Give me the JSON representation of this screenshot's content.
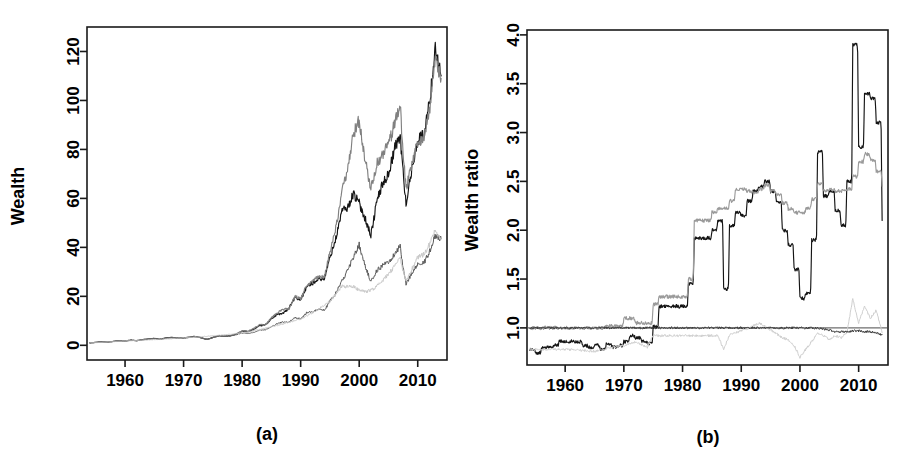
{
  "figure": {
    "background_color": "#ffffff",
    "panel_count": 2
  },
  "chart_data": [
    {
      "id": "panel-a",
      "type": "line",
      "title": "",
      "caption": "(a)",
      "xlabel": "",
      "ylabel": "Wealth",
      "xlim": [
        1953.5,
        2015.0
      ],
      "ylim": [
        -6,
        130
      ],
      "xticks": [
        1960,
        1970,
        1980,
        1990,
        2000,
        2010
      ],
      "xtick_labels": [
        "1960",
        "1970",
        "1980",
        "1990",
        "2000",
        "2010"
      ],
      "yticks": [
        0,
        20,
        40,
        60,
        80,
        100,
        120
      ],
      "ytick_labels": [
        "0",
        "20",
        "40",
        "60",
        "80",
        "100",
        "120"
      ],
      "grid": false,
      "legend": "none",
      "series": [
        {
          "name": "wealth-black",
          "color": "#141414",
          "x": [
            1954,
            1955,
            1956,
            1957,
            1958,
            1959,
            1960,
            1961,
            1962,
            1963,
            1964,
            1965,
            1966,
            1967,
            1968,
            1969,
            1970,
            1971,
            1972,
            1973,
            1974,
            1975,
            1976,
            1977,
            1978,
            1979,
            1980,
            1981,
            1982,
            1983,
            1984,
            1985,
            1986,
            1987,
            1988,
            1989,
            1990,
            1991,
            1992,
            1993,
            1994,
            1995,
            1996,
            1997,
            1998,
            1999,
            2000,
            2001,
            2002,
            2003,
            2004,
            2005,
            2006,
            2007,
            2008,
            2009,
            2010,
            2011,
            2012,
            2013,
            2014
          ],
          "values": [
            1.0,
            1.2,
            1.4,
            1.3,
            1.6,
            1.8,
            1.8,
            2.1,
            1.9,
            2.3,
            2.6,
            2.8,
            2.5,
            3.0,
            3.2,
            2.9,
            3.0,
            3.3,
            3.6,
            3.1,
            2.4,
            3.2,
            3.9,
            3.7,
            3.9,
            4.5,
            5.8,
            5.6,
            6.6,
            8.0,
            8.4,
            10.9,
            12.6,
            13.0,
            15.2,
            19.5,
            18.6,
            23.8,
            25.3,
            27.3,
            27.0,
            36.0,
            43.5,
            55.0,
            56.0,
            62.0,
            58.0,
            52.0,
            45.0,
            59.0,
            66.0,
            70.0,
            80.0,
            86.0,
            58.0,
            72.0,
            84.0,
            86.0,
            99.0,
            122.0,
            110.0
          ]
        },
        {
          "name": "wealth-gray-upper",
          "color": "#808080",
          "x": [
            1954,
            1955,
            1956,
            1957,
            1958,
            1959,
            1960,
            1961,
            1962,
            1963,
            1964,
            1965,
            1966,
            1967,
            1968,
            1969,
            1970,
            1971,
            1972,
            1973,
            1974,
            1975,
            1976,
            1977,
            1978,
            1979,
            1980,
            1981,
            1982,
            1983,
            1984,
            1985,
            1986,
            1987,
            1988,
            1989,
            1990,
            1991,
            1992,
            1993,
            1994,
            1995,
            1996,
            1997,
            1998,
            1999,
            2000,
            2001,
            2002,
            2003,
            2004,
            2005,
            2006,
            2007,
            2008,
            2009,
            2010,
            2011,
            2012,
            2013,
            2014
          ],
          "values": [
            1.0,
            1.2,
            1.4,
            1.3,
            1.6,
            1.8,
            1.8,
            2.1,
            1.9,
            2.3,
            2.6,
            2.8,
            2.5,
            3.0,
            3.2,
            2.9,
            3.0,
            3.3,
            3.6,
            3.1,
            2.4,
            3.2,
            3.9,
            3.7,
            3.9,
            4.6,
            6.0,
            5.8,
            6.9,
            8.4,
            8.6,
            11.2,
            13.4,
            14.6,
            15.0,
            20.0,
            19.0,
            24.5,
            26.0,
            28.0,
            28.0,
            38.0,
            48.0,
            62.0,
            72.0,
            86.0,
            92.0,
            76.0,
            64.0,
            74.0,
            78.0,
            82.0,
            90.0,
            99.0,
            64.0,
            74.0,
            83.0,
            84.0,
            96.0,
            117.0,
            109.0
          ]
        },
        {
          "name": "wealth-gray-lower",
          "color": "#5a5a5a",
          "x": [
            1954,
            1955,
            1956,
            1957,
            1958,
            1959,
            1960,
            1961,
            1962,
            1963,
            1964,
            1965,
            1966,
            1967,
            1968,
            1969,
            1970,
            1971,
            1972,
            1973,
            1974,
            1975,
            1976,
            1977,
            1978,
            1979,
            1980,
            1981,
            1982,
            1983,
            1984,
            1985,
            1986,
            1987,
            1988,
            1989,
            1990,
            1991,
            1992,
            1993,
            1994,
            1995,
            1996,
            1997,
            1998,
            1999,
            2000,
            2001,
            2002,
            2003,
            2004,
            2005,
            2006,
            2007,
            2008,
            2009,
            2010,
            2011,
            2012,
            2013,
            2014
          ],
          "values": [
            1.0,
            1.2,
            1.4,
            1.3,
            1.6,
            1.8,
            1.8,
            2.1,
            1.9,
            2.3,
            2.6,
            2.8,
            2.5,
            3.0,
            3.2,
            2.9,
            3.0,
            3.3,
            3.6,
            3.1,
            2.4,
            3.2,
            3.9,
            3.7,
            3.9,
            4.4,
            5.0,
            4.8,
            5.3,
            6.2,
            6.3,
            7.6,
            8.8,
            9.6,
            9.4,
            11.4,
            10.8,
            13.2,
            13.8,
            14.6,
            14.3,
            18.0,
            21.5,
            26.0,
            30.5,
            36.0,
            41.0,
            33.0,
            26.0,
            30.5,
            32.5,
            34.0,
            37.0,
            40.5,
            25.0,
            29.5,
            33.0,
            33.5,
            38.0,
            45.0,
            43.5
          ]
        },
        {
          "name": "wealth-lightgray",
          "color": "#c8c8c8",
          "x": [
            1954,
            1960,
            1970,
            1980,
            1985,
            1990,
            1995,
            1997,
            1999,
            2000,
            2001,
            2002,
            2003,
            2004,
            2005,
            2006,
            2007,
            2008,
            2009,
            2010,
            2011,
            2012,
            2013,
            2014
          ],
          "values": [
            1.0,
            1.8,
            3.0,
            5.0,
            7.6,
            10.8,
            18.0,
            24.0,
            24.0,
            22.5,
            22.0,
            22.5,
            24.0,
            26.5,
            29.0,
            32.0,
            36.0,
            26.0,
            31.0,
            36.0,
            37.0,
            41.0,
            47.0,
            43.5
          ]
        }
      ]
    },
    {
      "id": "panel-b",
      "type": "line",
      "title": "",
      "caption": "(b)",
      "xlabel": "",
      "ylabel": "Wealth ratio",
      "xlim": [
        1953.5,
        2015.0
      ],
      "ylim": [
        0.62,
        4.05
      ],
      "xticks": [
        1960,
        1970,
        1980,
        1990,
        2000,
        2010
      ],
      "xtick_labels": [
        "1960",
        "1970",
        "1980",
        "1990",
        "2000",
        "2010"
      ],
      "yticks": [
        1.0,
        1.5,
        2.0,
        2.5,
        3.0,
        3.5,
        4.0
      ],
      "ytick_labels": [
        "1.0",
        "1.5",
        "2.0",
        "2.5",
        "3.0",
        "3.5",
        "4.0"
      ],
      "grid": false,
      "legend": "none",
      "reference_line": {
        "name": "unity-reference",
        "value": 1.0,
        "color": "#6e6e6e"
      },
      "series": [
        {
          "name": "ratio-black-step",
          "color": "#141414",
          "step": true,
          "x": [
            1954,
            1955,
            1956,
            1957,
            1958,
            1959,
            1960,
            1961,
            1962,
            1963,
            1964,
            1965,
            1966,
            1967,
            1968,
            1969,
            1970,
            1971,
            1972,
            1973,
            1974,
            1975,
            1976,
            1977,
            1978,
            1979,
            1980,
            1981,
            1982,
            1983,
            1984,
            1985,
            1986,
            1987,
            1988,
            1989,
            1990,
            1991,
            1992,
            1993,
            1994,
            1995,
            1996,
            1997,
            1998,
            1999,
            2000,
            2001,
            2002,
            2003,
            2004,
            2005,
            2006,
            2007,
            2008,
            2009,
            2010,
            2011,
            2012,
            2013,
            2014
          ],
          "values": [
            0.78,
            0.74,
            0.8,
            0.8,
            0.82,
            0.86,
            0.86,
            0.86,
            0.86,
            0.82,
            0.8,
            0.82,
            0.78,
            0.84,
            0.8,
            0.82,
            0.86,
            0.92,
            0.9,
            0.86,
            0.84,
            1.01,
            1.22,
            1.22,
            1.22,
            1.22,
            1.22,
            1.45,
            1.92,
            1.92,
            1.92,
            2.0,
            2.1,
            1.4,
            2.05,
            2.18,
            2.15,
            2.3,
            2.4,
            2.45,
            2.5,
            2.4,
            2.28,
            2.0,
            1.85,
            1.6,
            1.3,
            1.35,
            1.9,
            2.8,
            2.35,
            2.4,
            2.2,
            2.05,
            2.5,
            3.9,
            2.85,
            3.4,
            3.35,
            3.1,
            2.1
          ]
        },
        {
          "name": "ratio-gray-step",
          "color": "#9a9a9a",
          "step": true,
          "x": [
            1954,
            1955,
            1956,
            1957,
            1958,
            1959,
            1960,
            1961,
            1962,
            1963,
            1964,
            1965,
            1966,
            1967,
            1968,
            1969,
            1970,
            1971,
            1972,
            1973,
            1974,
            1975,
            1976,
            1977,
            1978,
            1979,
            1980,
            1981,
            1982,
            1983,
            1984,
            1985,
            1986,
            1987,
            1988,
            1989,
            1990,
            1991,
            1992,
            1993,
            1994,
            1995,
            1996,
            1997,
            1998,
            1999,
            2000,
            2001,
            2002,
            2003,
            2004,
            2005,
            2006,
            2007,
            2008,
            2009,
            2010,
            2011,
            2012,
            2013,
            2014
          ],
          "values": [
            1.0,
            1.0,
            1.0,
            1.0,
            1.0,
            1.0,
            1.0,
            1.0,
            1.0,
            1.0,
            1.0,
            1.0,
            1.0,
            1.02,
            1.02,
            1.02,
            1.1,
            1.1,
            1.05,
            1.05,
            1.05,
            1.24,
            1.32,
            1.32,
            1.32,
            1.32,
            1.32,
            1.5,
            2.1,
            2.1,
            2.1,
            2.18,
            2.22,
            2.22,
            2.3,
            2.42,
            2.42,
            2.4,
            2.38,
            2.42,
            2.46,
            2.4,
            2.36,
            2.28,
            2.22,
            2.18,
            2.18,
            2.22,
            2.32,
            2.48,
            2.4,
            2.42,
            2.4,
            2.4,
            2.42,
            2.55,
            2.7,
            2.78,
            2.72,
            2.6,
            2.45
          ]
        },
        {
          "name": "ratio-lightgray",
          "color": "#cfcfcf",
          "step": false,
          "x": [
            1954,
            1960,
            1965,
            1968,
            1970,
            1972,
            1974,
            1975,
            1980,
            1982,
            1984,
            1986,
            1987,
            1988,
            1989,
            1990,
            1991,
            1992,
            1993,
            1994,
            1995,
            1996,
            1997,
            1998,
            1999,
            2000,
            2001,
            2002,
            2003,
            2004,
            2005,
            2006,
            2007,
            2008,
            2009,
            2010,
            2011,
            2012,
            2013,
            2014
          ],
          "values": [
            0.78,
            0.78,
            0.76,
            0.8,
            0.82,
            0.86,
            0.8,
            0.92,
            0.92,
            0.92,
            0.92,
            0.92,
            0.78,
            0.93,
            0.95,
            0.97,
            0.99,
            1.02,
            1.05,
            1.02,
            0.98,
            0.94,
            0.9,
            0.88,
            0.82,
            0.7,
            0.78,
            0.86,
            0.94,
            0.92,
            0.88,
            0.92,
            0.9,
            0.95,
            1.3,
            1.05,
            1.22,
            1.1,
            1.18,
            0.95
          ]
        },
        {
          "name": "ratio-dark-flat",
          "color": "#3c3c3c",
          "step": false,
          "x": [
            1954,
            1970,
            1980,
            1990,
            2000,
            2003,
            2005,
            2006,
            2007,
            2008,
            2009,
            2010,
            2011,
            2012,
            2013,
            2014
          ],
          "values": [
            1.0,
            1.0,
            1.0,
            1.0,
            1.0,
            1.0,
            0.98,
            0.96,
            0.96,
            0.96,
            0.97,
            0.97,
            0.96,
            0.96,
            0.95,
            0.93
          ]
        }
      ]
    }
  ]
}
